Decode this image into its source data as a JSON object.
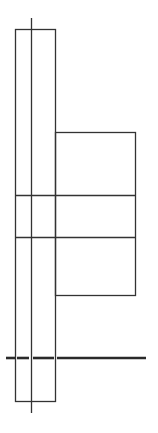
{
  "diagram": {
    "type": "line-drawing",
    "background": "#ffffff",
    "stroke_color": "#333333",
    "width": 158,
    "height": 433,
    "elements": {
      "tall_rect": {
        "x": 15,
        "y": 29,
        "w": 40,
        "h": 373
      },
      "center_axis": {
        "x": 31,
        "y1": 18,
        "y2": 413
      },
      "side_box": {
        "x": 55,
        "y": 132,
        "w": 80,
        "h": 164
      },
      "divider_top": {
        "y": 195,
        "x1": 15,
        "x2": 135
      },
      "divider_bottom": {
        "y": 237,
        "x1": 15,
        "x2": 135
      },
      "ground_line": {
        "y": 358,
        "x1": 6,
        "x2": 146,
        "stroke_width": 2.5
      }
    }
  }
}
